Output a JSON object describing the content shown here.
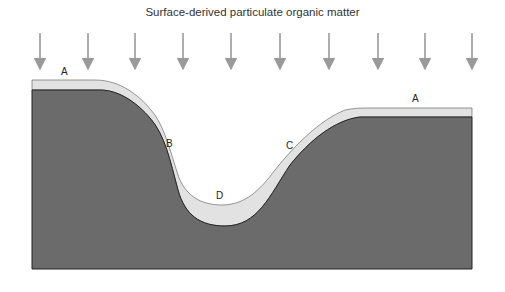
{
  "title": "Surface-derived particulate organic matter",
  "labels": {
    "a_left": "A",
    "a_right": "A",
    "b": "B",
    "c": "C",
    "d": "D"
  },
  "colors": {
    "rock": "#6b6b6b",
    "sediment": "#e2e2e2",
    "arrow": "#9a9a9a",
    "outline": "#222222"
  },
  "arrows_x": [
    40,
    88,
    135,
    183,
    231,
    280,
    329,
    378,
    425,
    472
  ]
}
